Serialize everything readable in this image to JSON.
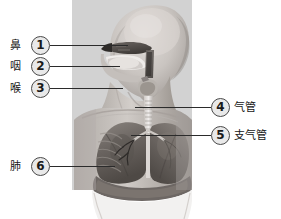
{
  "figure": {
    "panel": {
      "background_color": "#d2d2d2",
      "left": 72,
      "top": 0,
      "width": 120,
      "height": 190
    }
  },
  "callouts": [
    {
      "number": "1",
      "label": "鼻",
      "organ_en": "nose",
      "side": "left",
      "circle": {
        "x": 31,
        "y": 36
      },
      "label_pos": {
        "x": 10,
        "y": 39
      },
      "leader": {
        "x": 50,
        "y": 45,
        "width": 78
      }
    },
    {
      "number": "2",
      "label": "咽",
      "organ_en": "pharynx",
      "side": "left",
      "circle": {
        "x": 31,
        "y": 57
      },
      "label_pos": {
        "x": 10,
        "y": 60
      },
      "leader": {
        "x": 50,
        "y": 66,
        "width": 70
      }
    },
    {
      "number": "3",
      "label": "喉",
      "organ_en": "larynx",
      "side": "left",
      "circle": {
        "x": 31,
        "y": 79
      },
      "label_pos": {
        "x": 10,
        "y": 82
      },
      "leader": {
        "x": 50,
        "y": 88,
        "width": 73
      }
    },
    {
      "number": "4",
      "label": "气管",
      "organ_en": "trachea",
      "side": "right",
      "circle": {
        "x": 211,
        "y": 98
      },
      "label_pos": {
        "x": 234,
        "y": 101
      },
      "leader": {
        "x": 135,
        "y": 107,
        "width": 76
      }
    },
    {
      "number": "5",
      "label": "支气管",
      "organ_en": "bronchus",
      "side": "right",
      "circle": {
        "x": 211,
        "y": 126
      },
      "label_pos": {
        "x": 234,
        "y": 129
      },
      "leader": {
        "x": 131,
        "y": 135,
        "width": 80
      }
    },
    {
      "number": "6",
      "label": "肺",
      "organ_en": "lungs",
      "side": "left",
      "circle": {
        "x": 31,
        "y": 157
      },
      "label_pos": {
        "x": 10,
        "y": 160
      },
      "leader": {
        "x": 50,
        "y": 166,
        "width": 65
      }
    }
  ],
  "colors": {
    "panel_grey": "#d2d2d2",
    "leader_line": "#2b2b2b",
    "circle_fill": "#e9e9e9",
    "circle_stroke": "#4a4a4a",
    "text": "#161616",
    "skin_light": "#d8d4d0",
    "skin_mid": "#b4afaa",
    "skin_dark": "#8e8884",
    "organ_dark": "#5a5450",
    "organ_mid": "#7c7671",
    "page_bg": "#ffffff"
  }
}
